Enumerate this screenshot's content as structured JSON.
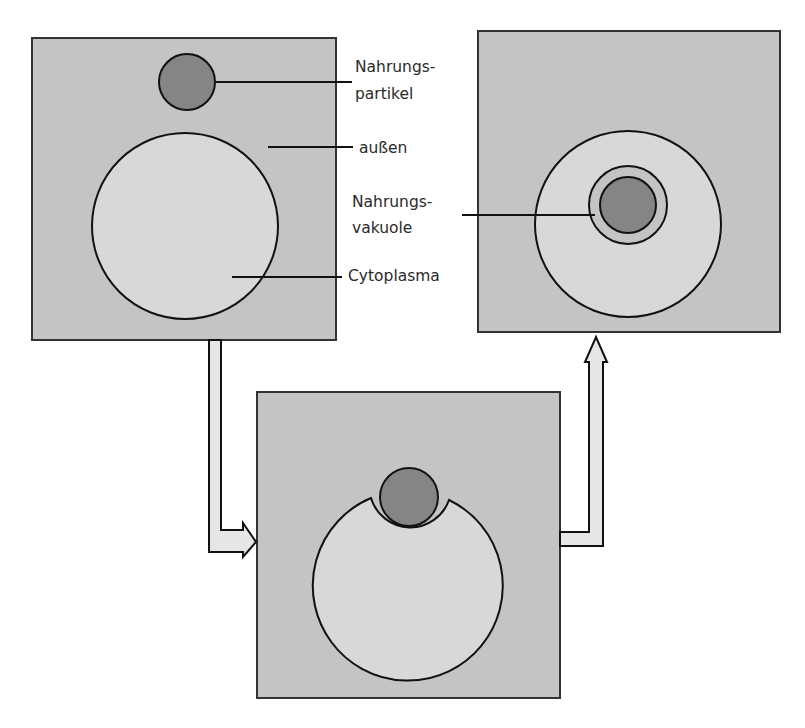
{
  "diagram": {
    "type": "process",
    "colors": {
      "outside": "#c4c4c4",
      "cytoplasm": "#d8d8d8",
      "particle": "#858585",
      "arrow_fill": "#e6e6e6",
      "stroke": "#111111"
    },
    "stages": [
      {
        "id": "stage-1",
        "description": "Nahrungspartikel außerhalb der Zelle"
      },
      {
        "id": "stage-2",
        "description": "Zellmembran umschließt Nahrungspartikel"
      },
      {
        "id": "stage-3",
        "description": "Nahrungsvakuole im Cytoplasma"
      }
    ],
    "labels": {
      "particle_1": "Nahrungs-",
      "particle_2": "partikel",
      "outside": "außen",
      "vacuole_1": "Nahrungs-",
      "vacuole_2": "vakuole",
      "cytoplasm": "Cytoplasma"
    },
    "arrows": [
      {
        "from": "stage-1",
        "to": "stage-2"
      },
      {
        "from": "stage-2",
        "to": "stage-3"
      }
    ]
  }
}
